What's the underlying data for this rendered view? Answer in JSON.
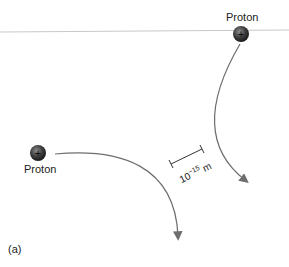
{
  "figure": {
    "panel_label": "(a)",
    "particles": [
      {
        "name": "Proton",
        "charge_symbol": "+",
        "position": "top-right"
      },
      {
        "name": "Proton",
        "charge_symbol": "+",
        "position": "left"
      }
    ],
    "scale_bar": {
      "base": "10",
      "exponent": "−15",
      "unit": "m"
    },
    "colors": {
      "proton_fill": "#3a3a3a",
      "trajectory": "#6e6e6e",
      "divider_line": "#c8c8c8",
      "text": "#222222"
    }
  }
}
